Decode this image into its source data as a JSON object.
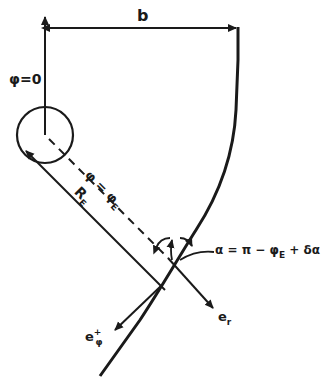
{
  "diagram": {
    "colors": {
      "ink": "#1a1a1a",
      "background": "#ffffff"
    },
    "labels": {
      "width": "b",
      "phi_zero": "φ=0",
      "phi_edge_main": "φ = φ",
      "phi_edge_sub": "E",
      "radius_main": "R",
      "radius_sub": "E",
      "angle_eq": "α = π − φ",
      "angle_eq_sub": "E",
      "angle_eq_tail": " + δα",
      "e_r_main": "e",
      "e_r_sub": "r",
      "e_phi_main": "e",
      "e_phi_sup": "+",
      "e_phi_sub": "φ"
    },
    "elements": [
      "vertical-axis-phi-zero",
      "width-dimension-arrow-b",
      "circle",
      "dashed-line-phi-E",
      "radius-line-R-E",
      "boundary-curve",
      "angle-arc-alpha",
      "unit-vector-e-r",
      "unit-vector-e-phi"
    ]
  }
}
